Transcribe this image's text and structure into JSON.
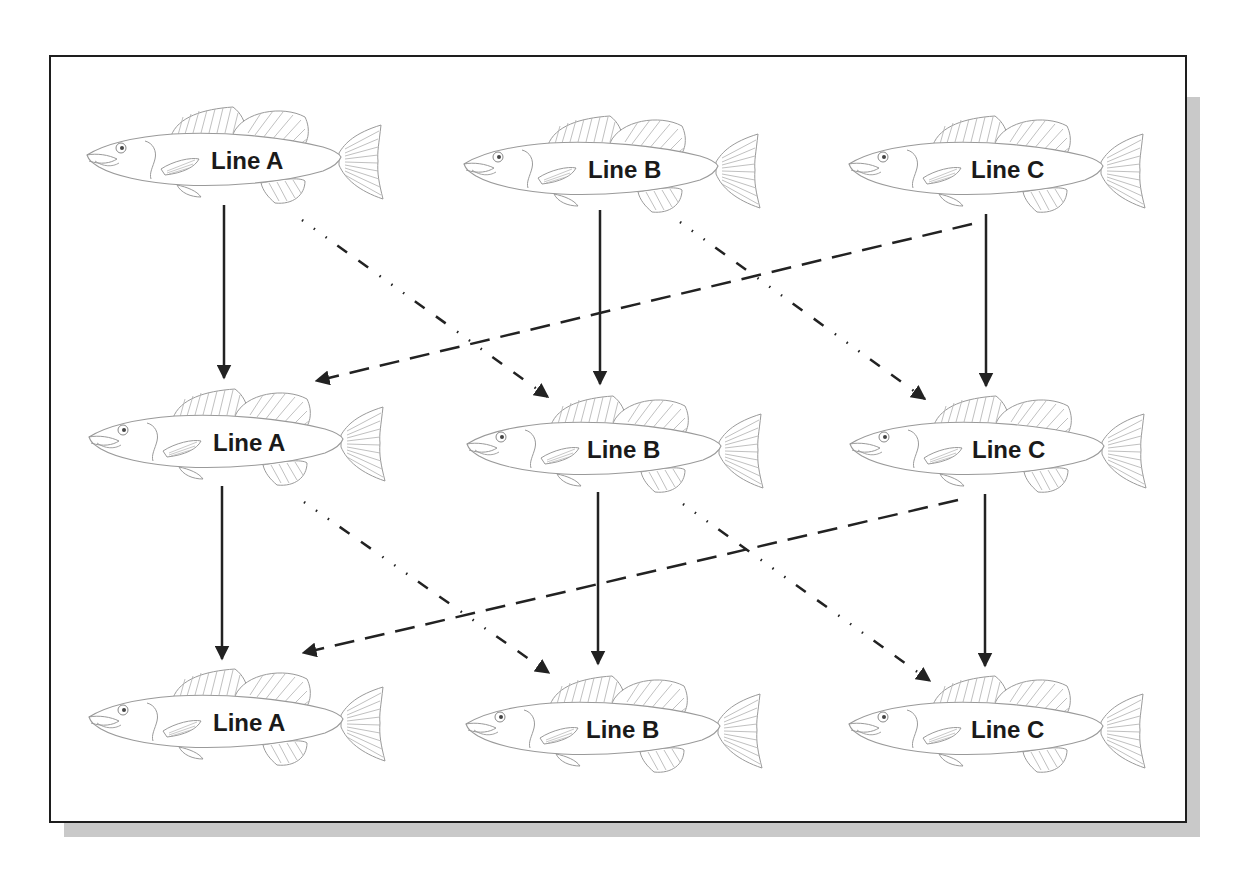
{
  "diagram": {
    "type": "breeding-scheme",
    "colors": {
      "arrow": "#222222",
      "fish_outline": "#9a9a9a",
      "frame": "#1e1e1e",
      "shadow": "#c9c9c9"
    },
    "rows": [
      {
        "generation": 1,
        "fish": [
          {
            "id": "A1",
            "label": "Line A",
            "x": 83,
            "y": 103
          },
          {
            "id": "B1",
            "label": "Line B",
            "x": 460,
            "y": 112
          },
          {
            "id": "C1",
            "label": "Line C",
            "x": 845,
            "y": 112
          }
        ]
      },
      {
        "generation": 2,
        "fish": [
          {
            "id": "A2",
            "label": "Line A",
            "x": 85,
            "y": 385
          },
          {
            "id": "B2",
            "label": "Line B",
            "x": 463,
            "y": 392
          },
          {
            "id": "C2",
            "label": "Line C",
            "x": 846,
            "y": 392
          }
        ]
      },
      {
        "generation": 3,
        "fish": [
          {
            "id": "A3",
            "label": "Line A",
            "x": 85,
            "y": 665
          },
          {
            "id": "B3",
            "label": "Line B",
            "x": 462,
            "y": 672
          },
          {
            "id": "C3",
            "label": "Line C",
            "x": 845,
            "y": 672
          }
        ]
      }
    ],
    "arrows": [
      {
        "from": "A1",
        "to": "A2",
        "style": "solid",
        "x1": 224,
        "y1": 205,
        "x2": 224,
        "y2": 377
      },
      {
        "from": "B1",
        "to": "B2",
        "style": "solid",
        "x1": 600,
        "y1": 210,
        "x2": 600,
        "y2": 383
      },
      {
        "from": "C1",
        "to": "C2",
        "style": "solid",
        "x1": 986,
        "y1": 214,
        "x2": 986,
        "y2": 385
      },
      {
        "from": "A1",
        "to": "B2",
        "style": "dash-dot-dot",
        "x1": 302,
        "y1": 220,
        "x2": 548,
        "y2": 396
      },
      {
        "from": "B1",
        "to": "C2",
        "style": "dash-dot-dot",
        "x1": 680,
        "y1": 222,
        "x2": 925,
        "y2": 398
      },
      {
        "from": "C1",
        "to": "A2",
        "style": "dashed",
        "x1": 972,
        "y1": 224,
        "x2": 318,
        "y2": 380
      },
      {
        "from": "A2",
        "to": "A3",
        "style": "solid",
        "x1": 222,
        "y1": 486,
        "x2": 222,
        "y2": 658
      },
      {
        "from": "B2",
        "to": "B3",
        "style": "solid",
        "x1": 598,
        "y1": 492,
        "x2": 598,
        "y2": 663
      },
      {
        "from": "C2",
        "to": "C3",
        "style": "solid",
        "x1": 985,
        "y1": 494,
        "x2": 985,
        "y2": 665
      },
      {
        "from": "A2",
        "to": "B3",
        "style": "dash-dot-dot",
        "x1": 304,
        "y1": 502,
        "x2": 549,
        "y2": 672
      },
      {
        "from": "B2",
        "to": "C3",
        "style": "dash-dot-dot",
        "x1": 683,
        "y1": 504,
        "x2": 930,
        "y2": 680
      },
      {
        "from": "C2",
        "to": "A3",
        "style": "dashed",
        "x1": 958,
        "y1": 500,
        "x2": 305,
        "y2": 652
      }
    ]
  },
  "fish": {
    "A1": {
      "label": "Line A"
    },
    "B1": {
      "label": "Line B"
    },
    "C1": {
      "label": "Line C"
    },
    "A2": {
      "label": "Line A"
    },
    "B2": {
      "label": "Line B"
    },
    "C2": {
      "label": "Line C"
    },
    "A3": {
      "label": "Line A"
    },
    "B3": {
      "label": "Line B"
    },
    "C3": {
      "label": "Line C"
    }
  }
}
